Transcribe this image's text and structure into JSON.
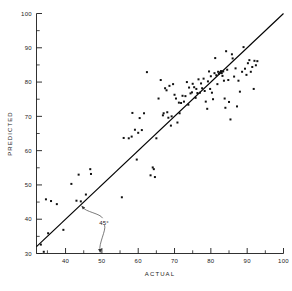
{
  "chart_data": {
    "type": "scatter",
    "title": "",
    "xlabel": "ACTUAL",
    "ylabel": "PREDICTED",
    "xlim": [
      32,
      100
    ],
    "ylim": [
      30,
      100
    ],
    "grid": false,
    "legend": "none",
    "x_ticks": [
      40,
      50,
      60,
      70,
      80,
      90,
      100
    ],
    "x_tick_labels": [
      "40",
      "50",
      "60",
      "70",
      "80",
      "90",
      "100"
    ],
    "x_minor_ticks": [
      35,
      45,
      55,
      65,
      75,
      85,
      95
    ],
    "y_ticks": [
      30,
      40,
      50,
      60,
      70,
      80,
      90,
      100
    ],
    "y_tick_labels": [
      "30",
      "40",
      "50",
      "60",
      "70",
      "80",
      "90",
      "100"
    ],
    "y_minor_ticks": [
      35,
      45,
      55,
      65,
      75,
      85,
      95
    ],
    "marker": "square",
    "marker_color": "#111111",
    "reference_line": {
      "label": "45°",
      "slope": 1,
      "intercept": 0,
      "from": [
        32,
        32
      ],
      "to": [
        100,
        100
      ],
      "color": "#000000"
    },
    "annotations": [
      {
        "text": "45°",
        "x": 50.6,
        "y": 39.0,
        "points_to_line_at": [
          44.2,
          44.2
        ],
        "points_to_axis_at": [
          49.6,
          30.0
        ]
      }
    ],
    "points": [
      [
        33.2,
        32.6
      ],
      [
        34.0,
        30.5
      ],
      [
        34.6,
        45.8
      ],
      [
        35.2,
        35.9
      ],
      [
        36.0,
        45.3
      ],
      [
        37.6,
        44.4
      ],
      [
        39.4,
        36.9
      ],
      [
        41.6,
        50.3
      ],
      [
        43.0,
        45.4
      ],
      [
        43.6,
        53.0
      ],
      [
        44.2,
        45.2
      ],
      [
        45.6,
        47.2
      ],
      [
        46.8,
        54.6
      ],
      [
        47.0,
        53.2
      ],
      [
        55.5,
        46.4
      ],
      [
        56.0,
        63.7
      ],
      [
        57.4,
        63.6
      ],
      [
        58.2,
        64.1
      ],
      [
        58.4,
        71.0
      ],
      [
        59.1,
        66.1
      ],
      [
        59.6,
        57.4
      ],
      [
        60.0,
        65.2
      ],
      [
        60.4,
        69.5
      ],
      [
        61.0,
        66.0
      ],
      [
        61.6,
        70.9
      ],
      [
        62.4,
        82.9
      ],
      [
        63.4,
        52.8
      ],
      [
        64.0,
        55.1
      ],
      [
        64.3,
        54.6
      ],
      [
        64.6,
        52.3
      ],
      [
        65.0,
        63.6
      ],
      [
        65.6,
        75.2
      ],
      [
        66.2,
        80.6
      ],
      [
        66.8,
        70.3
      ],
      [
        67.0,
        70.9
      ],
      [
        67.4,
        78.2
      ],
      [
        67.8,
        77.6
      ],
      [
        68.0,
        71.2
      ],
      [
        68.3,
        69.6
      ],
      [
        68.6,
        78.9
      ],
      [
        69.0,
        67.3
      ],
      [
        69.2,
        70.0
      ],
      [
        69.6,
        79.4
      ],
      [
        70.0,
        76.3
      ],
      [
        70.4,
        75.2
      ],
      [
        70.8,
        68.2
      ],
      [
        71.2,
        74.0
      ],
      [
        71.4,
        70.9
      ],
      [
        71.8,
        73.9
      ],
      [
        72.2,
        76.0
      ],
      [
        72.6,
        74.3
      ],
      [
        73.0,
        75.9
      ],
      [
        73.4,
        80.0
      ],
      [
        73.8,
        73.4
      ],
      [
        74.0,
        78.4
      ],
      [
        74.4,
        76.7
      ],
      [
        74.8,
        77.0
      ],
      [
        75.0,
        79.5
      ],
      [
        75.4,
        78.5
      ],
      [
        75.8,
        75.4
      ],
      [
        76.0,
        78.0
      ],
      [
        76.3,
        76.8
      ],
      [
        76.6,
        80.8
      ],
      [
        77.0,
        76.9
      ],
      [
        77.3,
        79.6
      ],
      [
        77.6,
        78.2
      ],
      [
        78.0,
        81.0
      ],
      [
        78.3,
        77.4
      ],
      [
        78.6,
        74.3
      ],
      [
        79.0,
        72.2
      ],
      [
        79.2,
        80.2
      ],
      [
        79.5,
        83.1
      ],
      [
        79.8,
        78.0
      ],
      [
        80.0,
        81.7
      ],
      [
        80.3,
        76.9
      ],
      [
        80.6,
        75.0
      ],
      [
        81.0,
        82.6
      ],
      [
        81.2,
        87.0
      ],
      [
        81.5,
        82.0
      ],
      [
        81.8,
        79.4
      ],
      [
        82.0,
        83.0
      ],
      [
        82.2,
        82.4
      ],
      [
        82.5,
        82.8
      ],
      [
        82.8,
        83.2
      ],
      [
        83.0,
        82.6
      ],
      [
        83.2,
        81.8
      ],
      [
        83.4,
        83.1
      ],
      [
        83.6,
        80.4
      ],
      [
        83.8,
        75.2
      ],
      [
        84.0,
        72.5
      ],
      [
        84.2,
        89.0
      ],
      [
        84.5,
        83.6
      ],
      [
        84.8,
        80.6
      ],
      [
        85.0,
        74.2
      ],
      [
        85.4,
        69.1
      ],
      [
        85.8,
        88.1
      ],
      [
        86.0,
        86.9
      ],
      [
        86.4,
        81.6
      ],
      [
        86.8,
        84.0
      ],
      [
        87.2,
        72.9
      ],
      [
        87.6,
        80.4
      ],
      [
        88.0,
        77.2
      ],
      [
        88.6,
        83.0
      ],
      [
        89.0,
        90.2
      ],
      [
        89.4,
        83.9
      ],
      [
        89.8,
        82.1
      ],
      [
        90.2,
        85.5
      ],
      [
        90.6,
        86.4
      ],
      [
        91.0,
        83.0
      ],
      [
        91.4,
        84.4
      ],
      [
        91.8,
        78.0
      ],
      [
        92.0,
        86.2
      ],
      [
        92.4,
        84.9
      ],
      [
        92.8,
        86.1
      ]
    ]
  },
  "labels": {
    "x_axis_title": "ACTUAL",
    "y_axis_title": "PREDICTED",
    "angle_annotation": "45°"
  }
}
